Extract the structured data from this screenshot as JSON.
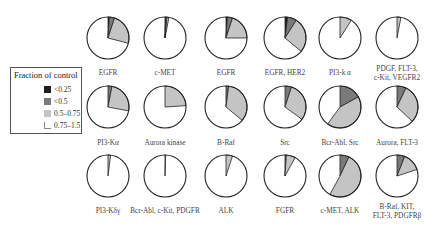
{
  "legend": {
    "title": "Fraction of control",
    "items": [
      {
        "label": "<0.25",
        "color": "#1e1e1e"
      },
      {
        "label": "<0.5",
        "color": "#7a7a7a"
      },
      {
        "label": "0.5–0.75",
        "color": "#c4c4c4"
      },
      {
        "label": "0.75–1.5",
        "color": "#ffffff"
      }
    ]
  },
  "chart_data": {
    "type": "pie",
    "title": "",
    "legend_title": "Fraction of control",
    "legend_position": "left",
    "categories": [
      "<0.25",
      "<0.5",
      "0.5–0.75",
      "0.75–1.5"
    ],
    "colors": [
      "#1e1e1e",
      "#7a7a7a",
      "#c4c4c4",
      "#ffffff"
    ],
    "pies": [
      {
        "label": "EGFR",
        "values": [
          0.01,
          0.04,
          0.24,
          0.71
        ]
      },
      {
        "label": "c-MET",
        "values": [
          0.005,
          0.01,
          0.015,
          0.97
        ]
      },
      {
        "label": "EGFR",
        "values": [
          0.01,
          0.04,
          0.2,
          0.75
        ]
      },
      {
        "label": "EGFR, HER2",
        "values": [
          0.02,
          0.07,
          0.27,
          0.64
        ]
      },
      {
        "label": "PI3-k α",
        "values": [
          0,
          0,
          0.09,
          0.91
        ]
      },
      {
        "label": "PDGF, FLT-3,\nc-Kit, VEGFR2",
        "values": [
          0,
          0,
          0.03,
          0.97
        ]
      },
      {
        "label": "PI3-Kα",
        "values": [
          0,
          0.03,
          0.25,
          0.72
        ]
      },
      {
        "label": "Aurora kinase",
        "values": [
          0,
          0,
          0.24,
          0.76
        ]
      },
      {
        "label": "B-Raf",
        "values": [
          0,
          0.02,
          0.34,
          0.64
        ]
      },
      {
        "label": "Src",
        "values": [
          0,
          0.05,
          0.3,
          0.65
        ]
      },
      {
        "label": "Bcr-Abl, Src",
        "values": [
          0,
          0.17,
          0.43,
          0.4
        ]
      },
      {
        "label": "Aurora, FLT-3",
        "values": [
          0,
          0.07,
          0.3,
          0.63
        ]
      },
      {
        "label": "PI3-Kδγ",
        "values": [
          0,
          0,
          0.02,
          0.98
        ]
      },
      {
        "label": "Bcr-Abl, c-Kit, PDGFR",
        "values": [
          0,
          0,
          0.005,
          0.995
        ]
      },
      {
        "label": "ALK",
        "values": [
          0,
          0,
          0.05,
          0.95
        ]
      },
      {
        "label": "FGFR",
        "values": [
          0,
          0.01,
          0.07,
          0.92
        ]
      },
      {
        "label": "c-MET, ALK",
        "values": [
          0,
          0.07,
          0.51,
          0.42
        ]
      },
      {
        "label": "B-Raf, KIT,\nFLT-3, PDGFRβ",
        "values": [
          0,
          0.06,
          0.14,
          0.8
        ]
      }
    ],
    "layout": {
      "rows": 3,
      "cols": 6,
      "grid": false
    }
  }
}
